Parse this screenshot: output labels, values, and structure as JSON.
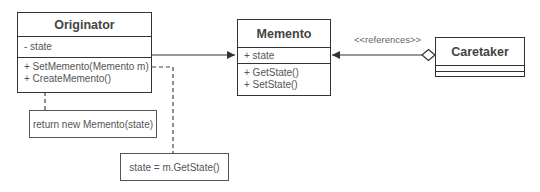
{
  "diagram": {
    "type": "UML class diagram",
    "pattern": "Memento"
  },
  "classes": {
    "originator": {
      "name": "Originator",
      "attributes": [
        "- state"
      ],
      "operations": [
        "+ SetMemento(Memento m)",
        "+ CreateMemento()"
      ]
    },
    "memento": {
      "name": "Memento",
      "attributes": [
        "+ state"
      ],
      "operations": [
        "+ GetState()",
        "+ SetState()"
      ]
    },
    "caretaker": {
      "name": "Caretaker",
      "attributes": [],
      "operations": []
    }
  },
  "notes": {
    "create_memento": "return new Memento(state)",
    "set_memento": "state = m.GetState()"
  },
  "relations": {
    "caretaker_memento_label": "<<references>>"
  },
  "colors": {
    "line": "#333333",
    "text": "#444444",
    "note_border": "#555555"
  }
}
